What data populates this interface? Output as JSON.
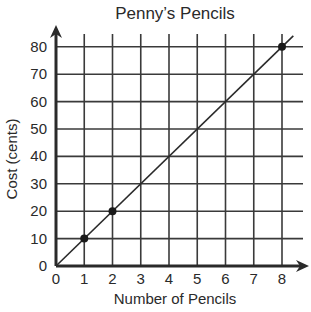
{
  "chart_data": {
    "type": "line",
    "title": "Penny’s Pencils",
    "xlabel": "Number of Pencils",
    "ylabel": "Cost (cents)",
    "x_ticks": [
      "0",
      "1",
      "2",
      "3",
      "4",
      "5",
      "6",
      "7",
      "8"
    ],
    "y_ticks": [
      "0",
      "10",
      "20",
      "30",
      "40",
      "50",
      "60",
      "70",
      "80"
    ],
    "xlim": [
      0,
      8.5
    ],
    "ylim": [
      0,
      85
    ],
    "grid": true,
    "legend": null,
    "series": [
      {
        "name": "Cost",
        "line": {
          "x": [
            0,
            8.4
          ],
          "y": [
            0,
            84
          ]
        },
        "points": [
          {
            "x": 1,
            "y": 10
          },
          {
            "x": 2,
            "y": 20
          },
          {
            "x": 8,
            "y": 80
          }
        ]
      }
    ],
    "colors": {
      "ink": "#2a2a2a",
      "grid": "#3a3a3a",
      "background": "#ffffff"
    }
  }
}
